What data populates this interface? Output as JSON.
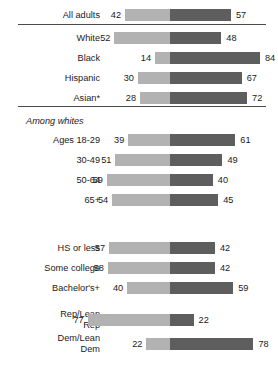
{
  "chart_data": {
    "type": "bar",
    "subtype": "diverging-stacked-bar",
    "title": "",
    "subtitle": "",
    "xlabel": "",
    "ylabel": "",
    "xlim": [
      0,
      100
    ],
    "grid": false,
    "legend_position": "none",
    "center_divider": true,
    "colors": {
      "left_segment": "#b2b2b2",
      "right_segment": "#5e5e5e",
      "rule": "#4a4a4a",
      "text": "#1a1a1a",
      "background": "#ffffff"
    },
    "series": [
      {
        "name": "left",
        "color": "#b2b2b2"
      },
      {
        "name": "right",
        "color": "#5e5e5e"
      }
    ],
    "categories": [
      "All adults",
      "White",
      "Black",
      "Hispanic",
      "Asian*",
      "Ages 18-29",
      "30-49",
      "50-64",
      "65+",
      "HS or less",
      "Some college",
      "Bachelor's+",
      "Rep/Lean Rep",
      "Dem/Lean Dem"
    ],
    "left_values": [
      42,
      52,
      14,
      30,
      28,
      39,
      51,
      59,
      54,
      57,
      58,
      40,
      77,
      22
    ],
    "right_values": [
      57,
      48,
      84,
      67,
      72,
      61,
      49,
      40,
      45,
      42,
      42,
      59,
      22,
      78
    ],
    "section_headings": [
      "Among whites"
    ]
  },
  "sections": [
    {
      "id": "overall",
      "heading": null,
      "rows": [
        {
          "label": "All adults",
          "left": 42,
          "right": 57
        }
      ]
    },
    {
      "id": "race",
      "heading": null,
      "rows": [
        {
          "label": "White",
          "left": 52,
          "right": 48
        },
        {
          "label": "Black",
          "left": 14,
          "right": 84
        },
        {
          "label": "Hispanic",
          "left": 30,
          "right": 67
        },
        {
          "label": "Asian*",
          "left": 28,
          "right": 72
        }
      ]
    },
    {
      "id": "age-among-whites",
      "heading": "Among whites",
      "rows": [
        {
          "label": "Ages 18-29",
          "left": 39,
          "right": 61
        },
        {
          "label": "30-49",
          "left": 51,
          "right": 49
        },
        {
          "label": "50-64",
          "left": 59,
          "right": 40
        },
        {
          "label": "65+",
          "left": 54,
          "right": 45
        }
      ]
    },
    {
      "id": "education",
      "heading": null,
      "rows": [
        {
          "label": "HS or less",
          "left": 57,
          "right": 42
        },
        {
          "label": "Some college",
          "left": 58,
          "right": 42
        },
        {
          "label": "Bachelor's+",
          "left": 40,
          "right": 59
        }
      ]
    },
    {
      "id": "party",
      "heading": null,
      "rows": [
        {
          "label": "Rep/Lean\nRep",
          "left": 77,
          "right": 22,
          "two_line": true
        },
        {
          "label": "Dem/Lean\nDem",
          "left": 22,
          "right": 78,
          "two_line": true
        }
      ]
    }
  ],
  "layout": {
    "center_x": 170,
    "px_per_unit": 1.07,
    "bar_height": 12,
    "row_pitch": 20,
    "row_tops": [
      5,
      28,
      48,
      68,
      88,
      130,
      150,
      170,
      190,
      238,
      258,
      278,
      310,
      334
    ],
    "heading_positions": [
      {
        "text": "Among whites",
        "top": 114
      }
    ],
    "rules": [
      {
        "top": 24
      },
      {
        "top": 106
      }
    ]
  }
}
